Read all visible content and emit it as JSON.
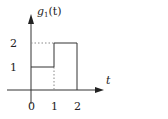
{
  "title": "g1(t)",
  "y_label": {
    "func": "g",
    "sub": "1",
    "arg": "(t)"
  },
  "x_label": "t",
  "x_ticks": [
    "0",
    "1",
    "2"
  ],
  "y_ticks": [
    "1",
    "2"
  ],
  "signal": {
    "segments": [
      {
        "t_start": 0,
        "t_end": 1,
        "value": 1
      },
      {
        "t_start": 1,
        "t_end": 2,
        "value": 2
      }
    ]
  },
  "colors": {
    "line": "#333333",
    "dotted": "#888888"
  }
}
